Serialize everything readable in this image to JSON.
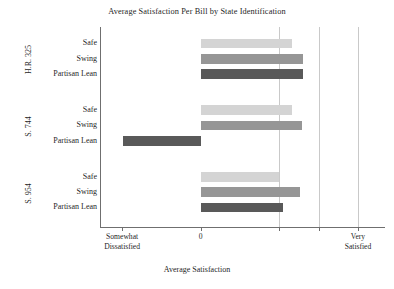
{
  "chart_data": {
    "type": "bar",
    "orientation": "horizontal",
    "title": "Average Satisfaction Per Bill by State Identification",
    "xlabel": "Average Satisfaction",
    "ylabel": "",
    "xlim": [
      -2.55,
      4.7
    ],
    "grid": true,
    "legend": "none",
    "xticks": [
      {
        "value": -2,
        "label": "Somewhat\nDissatisfied"
      },
      {
        "value": 0,
        "label": "0"
      },
      {
        "value": 2,
        "label": ""
      },
      {
        "value": 3,
        "label": ""
      },
      {
        "value": 4,
        "label": "Very\nSatisfied"
      }
    ],
    "gridline_values": [
      2,
      3,
      4
    ],
    "categories": [
      "Safe",
      "Swing",
      "Partisan Lean"
    ],
    "panels": [
      {
        "name": "H.R. 325",
        "bars": [
          {
            "category": "Safe",
            "value": 2.32,
            "color": "#d4d4d4"
          },
          {
            "category": "Swing",
            "value": 2.61,
            "color": "#969696"
          },
          {
            "category": "Partisan Lean",
            "value": 2.61,
            "color": "#595959"
          }
        ]
      },
      {
        "name": "S. 744",
        "bars": [
          {
            "category": "Safe",
            "value": 2.32,
            "color": "#d4d4d4"
          },
          {
            "category": "Swing",
            "value": 2.57,
            "color": "#969696"
          },
          {
            "category": "Partisan Lean",
            "value": -1.97,
            "color": "#595959"
          }
        ]
      },
      {
        "name": "S. 954",
        "bars": [
          {
            "category": "Safe",
            "value": 1.98,
            "color": "#d4d4d4"
          },
          {
            "category": "Swing",
            "value": 2.53,
            "color": "#969696"
          },
          {
            "category": "Partisan Lean",
            "value": 2.09,
            "color": "#595959"
          }
        ]
      }
    ]
  }
}
